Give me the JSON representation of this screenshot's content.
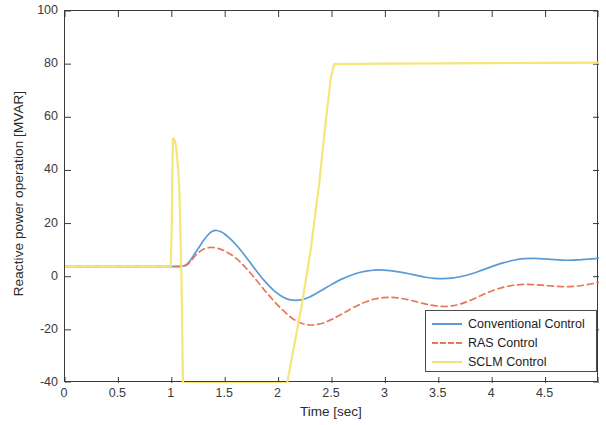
{
  "chart_data": {
    "type": "line",
    "title": "",
    "xlabel": "Time [sec]",
    "ylabel": "Reactive power operation [MVAR]",
    "xlim": [
      0,
      5
    ],
    "ylim": [
      -40,
      100
    ],
    "xticks": [
      "0",
      "0.5",
      "1",
      "1.5",
      "2",
      "2.5",
      "3",
      "3.5",
      "4",
      "4.5"
    ],
    "xtick_values": [
      0,
      0.5,
      1,
      1.5,
      2,
      2.5,
      3,
      3.5,
      4,
      4.5
    ],
    "yticks": [
      "100",
      "80",
      "60",
      "40",
      "20",
      "0",
      "-20",
      "-40"
    ],
    "ytick_values": [
      100,
      80,
      60,
      40,
      20,
      0,
      -20,
      -40
    ],
    "grid": false,
    "legend_position": "lower right",
    "series": [
      {
        "name": "Conventional Control",
        "color": "#5b9bd5",
        "style": "solid",
        "points": [
          [
            0.0,
            3.8
          ],
          [
            0.2,
            3.8
          ],
          [
            0.4,
            3.8
          ],
          [
            0.6,
            3.8
          ],
          [
            0.8,
            3.8
          ],
          [
            0.95,
            3.8
          ],
          [
            1.0,
            3.8
          ],
          [
            1.05,
            3.9
          ],
          [
            1.1,
            4.0
          ],
          [
            1.14,
            4.6
          ],
          [
            1.18,
            6.5
          ],
          [
            1.22,
            9.0
          ],
          [
            1.26,
            11.4
          ],
          [
            1.3,
            13.8
          ],
          [
            1.34,
            15.8
          ],
          [
            1.38,
            17.1
          ],
          [
            1.42,
            17.4
          ],
          [
            1.46,
            16.9
          ],
          [
            1.5,
            15.9
          ],
          [
            1.56,
            13.8
          ],
          [
            1.62,
            11.2
          ],
          [
            1.68,
            8.2
          ],
          [
            1.74,
            5.0
          ],
          [
            1.8,
            1.8
          ],
          [
            1.86,
            -1.2
          ],
          [
            1.92,
            -3.8
          ],
          [
            1.98,
            -6.0
          ],
          [
            2.04,
            -7.6
          ],
          [
            2.1,
            -8.6
          ],
          [
            2.16,
            -8.9
          ],
          [
            2.22,
            -8.6
          ],
          [
            2.28,
            -7.8
          ],
          [
            2.34,
            -6.6
          ],
          [
            2.42,
            -4.7
          ],
          [
            2.5,
            -2.8
          ],
          [
            2.58,
            -1.1
          ],
          [
            2.66,
            0.3
          ],
          [
            2.74,
            1.4
          ],
          [
            2.82,
            2.1
          ],
          [
            2.9,
            2.5
          ],
          [
            2.98,
            2.5
          ],
          [
            3.06,
            2.2
          ],
          [
            3.14,
            1.7
          ],
          [
            3.22,
            1.1
          ],
          [
            3.3,
            0.4
          ],
          [
            3.38,
            -0.2
          ],
          [
            3.46,
            -0.6
          ],
          [
            3.54,
            -0.7
          ],
          [
            3.62,
            -0.5
          ],
          [
            3.7,
            0.0
          ],
          [
            3.8,
            1.0
          ],
          [
            3.9,
            2.4
          ],
          [
            4.0,
            3.9
          ],
          [
            4.1,
            5.2
          ],
          [
            4.2,
            6.2
          ],
          [
            4.3,
            6.8
          ],
          [
            4.4,
            6.9
          ],
          [
            4.5,
            6.7
          ],
          [
            4.6,
            6.4
          ],
          [
            4.7,
            6.2
          ],
          [
            4.8,
            6.3
          ],
          [
            4.9,
            6.6
          ],
          [
            5.0,
            7.0
          ]
        ]
      },
      {
        "name": "RAS Control",
        "color": "#e8765a",
        "style": "dashed",
        "points": [
          [
            0.0,
            3.8
          ],
          [
            0.2,
            3.8
          ],
          [
            0.4,
            3.8
          ],
          [
            0.6,
            3.8
          ],
          [
            0.8,
            3.8
          ],
          [
            0.95,
            3.8
          ],
          [
            1.0,
            3.8
          ],
          [
            1.05,
            3.8
          ],
          [
            1.1,
            3.9
          ],
          [
            1.14,
            4.4
          ],
          [
            1.18,
            6.0
          ],
          [
            1.22,
            7.9
          ],
          [
            1.26,
            9.4
          ],
          [
            1.3,
            10.4
          ],
          [
            1.34,
            10.9
          ],
          [
            1.38,
            11.0
          ],
          [
            1.42,
            10.8
          ],
          [
            1.46,
            10.3
          ],
          [
            1.5,
            9.6
          ],
          [
            1.56,
            8.2
          ],
          [
            1.62,
            6.3
          ],
          [
            1.68,
            3.9
          ],
          [
            1.74,
            1.2
          ],
          [
            1.8,
            -1.7
          ],
          [
            1.86,
            -4.7
          ],
          [
            1.92,
            -7.5
          ],
          [
            1.98,
            -10.2
          ],
          [
            2.04,
            -12.6
          ],
          [
            2.1,
            -14.8
          ],
          [
            2.16,
            -16.5
          ],
          [
            2.22,
            -17.6
          ],
          [
            2.28,
            -18.1
          ],
          [
            2.34,
            -18.1
          ],
          [
            2.42,
            -17.4
          ],
          [
            2.5,
            -16.0
          ],
          [
            2.58,
            -14.3
          ],
          [
            2.66,
            -12.5
          ],
          [
            2.74,
            -10.8
          ],
          [
            2.82,
            -9.4
          ],
          [
            2.9,
            -8.4
          ],
          [
            2.98,
            -7.9
          ],
          [
            3.06,
            -7.8
          ],
          [
            3.14,
            -8.1
          ],
          [
            3.22,
            -8.7
          ],
          [
            3.3,
            -9.5
          ],
          [
            3.38,
            -10.3
          ],
          [
            3.46,
            -10.9
          ],
          [
            3.54,
            -11.2
          ],
          [
            3.62,
            -11.0
          ],
          [
            3.7,
            -10.3
          ],
          [
            3.8,
            -8.8
          ],
          [
            3.9,
            -7.0
          ],
          [
            4.0,
            -5.3
          ],
          [
            4.1,
            -4.0
          ],
          [
            4.2,
            -3.2
          ],
          [
            4.3,
            -2.9
          ],
          [
            4.4,
            -3.0
          ],
          [
            4.5,
            -3.3
          ],
          [
            4.6,
            -3.6
          ],
          [
            4.7,
            -3.7
          ],
          [
            4.8,
            -3.5
          ],
          [
            4.9,
            -2.9
          ],
          [
            5.0,
            -2.1
          ]
        ]
      },
      {
        "name": "SCLM Control",
        "color": "#f5e57a",
        "style": "solid",
        "points": [
          [
            0.0,
            3.8
          ],
          [
            0.5,
            3.8
          ],
          [
            0.9,
            3.8
          ],
          [
            0.99,
            3.8
          ],
          [
            1.0,
            20.0
          ],
          [
            1.005,
            40.0
          ],
          [
            1.01,
            52.0
          ],
          [
            1.02,
            52.0
          ],
          [
            1.03,
            51.0
          ],
          [
            1.04,
            49.0
          ],
          [
            1.05,
            45.0
          ],
          [
            1.06,
            40.0
          ],
          [
            1.07,
            33.0
          ],
          [
            1.075,
            26.0
          ],
          [
            1.08,
            18.0
          ],
          [
            1.085,
            9.0
          ],
          [
            1.09,
            0.0
          ],
          [
            1.095,
            -14.0
          ],
          [
            1.1,
            -28.0
          ],
          [
            1.105,
            -40.0
          ],
          [
            2.08,
            -40.0
          ],
          [
            2.15,
            -25.0
          ],
          [
            2.22,
            -10.0
          ],
          [
            2.3,
            10.0
          ],
          [
            2.38,
            35.0
          ],
          [
            2.44,
            58.0
          ],
          [
            2.49,
            75.0
          ],
          [
            2.52,
            80.0
          ],
          [
            3.0,
            80.2
          ],
          [
            3.5,
            80.3
          ],
          [
            4.0,
            80.4
          ],
          [
            4.5,
            80.5
          ],
          [
            5.0,
            80.6
          ]
        ]
      }
    ],
    "baseline_value": 3.8,
    "spike_peak": 52,
    "sclm_plateau": 80
  },
  "legend": {
    "entries": [
      {
        "label": "Conventional Control",
        "color": "#5b9bd5",
        "style": "solid"
      },
      {
        "label": "RAS Control",
        "color": "#e8765a",
        "style": "dashed"
      },
      {
        "label": "SCLM Control",
        "color": "#f0e27a",
        "style": "solid"
      }
    ]
  }
}
